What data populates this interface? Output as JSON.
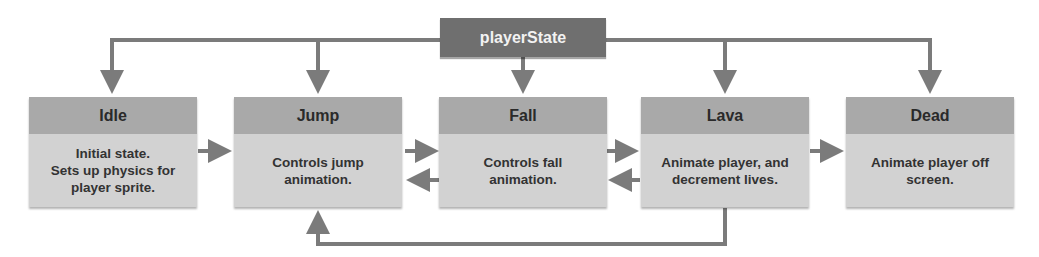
{
  "diagram": {
    "root": {
      "label": "playerState"
    },
    "states": [
      {
        "id": "idle",
        "title": "Idle",
        "description": "Initial state.\nSets up physics for\nplayer sprite."
      },
      {
        "id": "jump",
        "title": "Jump",
        "description": "Controls jump\nanimation."
      },
      {
        "id": "fall",
        "title": "Fall",
        "description": "Controls fall\nanimation."
      },
      {
        "id": "lava",
        "title": "Lava",
        "description": "Animate player, and\ndecrement lives."
      },
      {
        "id": "dead",
        "title": "Dead",
        "description": "Animate player off\nscreen."
      }
    ],
    "transitions": [
      {
        "from": "playerState",
        "to": "Idle"
      },
      {
        "from": "playerState",
        "to": "Jump"
      },
      {
        "from": "playerState",
        "to": "Fall"
      },
      {
        "from": "playerState",
        "to": "Lava"
      },
      {
        "from": "playerState",
        "to": "Dead"
      },
      {
        "from": "Idle",
        "to": "Jump"
      },
      {
        "from": "Jump",
        "to": "Fall"
      },
      {
        "from": "Fall",
        "to": "Jump"
      },
      {
        "from": "Fall",
        "to": "Lava"
      },
      {
        "from": "Lava",
        "to": "Fall"
      },
      {
        "from": "Lava",
        "to": "Dead"
      },
      {
        "from": "Lava",
        "to": "Jump"
      }
    ],
    "colors": {
      "root_fill": "#6f6f6f",
      "header_fill": "#a9a9a9",
      "body_fill": "#d2d2d2",
      "arrow": "#7b7b7b"
    }
  }
}
